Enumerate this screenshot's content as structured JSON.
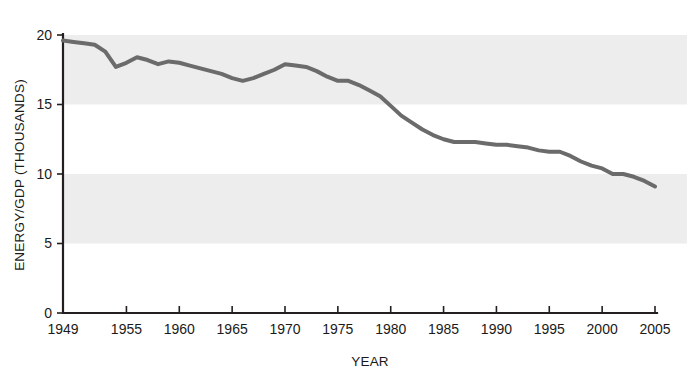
{
  "chart_data": {
    "type": "line",
    "title": "",
    "xlabel": "YEAR",
    "ylabel": "ENERGY/GDP (THOUSANDS)",
    "xlim": [
      1949,
      2005
    ],
    "ylim": [
      0,
      20
    ],
    "yticks": [
      0,
      5,
      10,
      15,
      20
    ],
    "ytick_labels": [
      "0",
      "5",
      "10",
      "15",
      "20"
    ],
    "xticks": [
      1949,
      1955,
      1960,
      1965,
      1970,
      1975,
      1980,
      1985,
      1990,
      1995,
      2000,
      2005
    ],
    "xtick_labels": [
      "1949",
      "1955",
      "1960",
      "1965",
      "1970",
      "1975",
      "1980",
      "1985",
      "1990",
      "1995",
      "2000",
      "2005"
    ],
    "grid": false,
    "legend": "none",
    "bands": [
      {
        "from": 15,
        "to": 20,
        "color": "#ededed"
      },
      {
        "from": 5,
        "to": 10,
        "color": "#ededed"
      }
    ],
    "series": [
      {
        "name": "Energy/GDP",
        "color": "#6b6b6b",
        "line_width": 4,
        "x": [
          1949,
          1950,
          1951,
          1952,
          1953,
          1954,
          1955,
          1956,
          1957,
          1958,
          1959,
          1960,
          1961,
          1962,
          1963,
          1964,
          1965,
          1966,
          1967,
          1968,
          1969,
          1970,
          1971,
          1972,
          1973,
          1974,
          1975,
          1976,
          1977,
          1978,
          1979,
          1980,
          1981,
          1982,
          1983,
          1984,
          1985,
          1986,
          1987,
          1988,
          1989,
          1990,
          1991,
          1992,
          1993,
          1994,
          1995,
          1996,
          1997,
          1998,
          1999,
          2000,
          2001,
          2002,
          2003,
          2004,
          2005
        ],
        "values": [
          19.6,
          19.5,
          19.4,
          19.3,
          18.8,
          17.7,
          18.0,
          18.4,
          18.2,
          17.9,
          18.1,
          18.0,
          17.8,
          17.6,
          17.4,
          17.2,
          16.9,
          16.7,
          16.9,
          17.2,
          17.5,
          17.9,
          17.8,
          17.7,
          17.4,
          17.0,
          16.7,
          16.7,
          16.4,
          16.0,
          15.6,
          14.9,
          14.2,
          13.7,
          13.2,
          12.8,
          12.5,
          12.3,
          12.3,
          12.3,
          12.2,
          12.1,
          12.1,
          12.0,
          11.9,
          11.7,
          11.6,
          11.6,
          11.3,
          10.9,
          10.6,
          10.4,
          10.0,
          10.0,
          9.8,
          9.5,
          9.1
        ]
      }
    ]
  }
}
